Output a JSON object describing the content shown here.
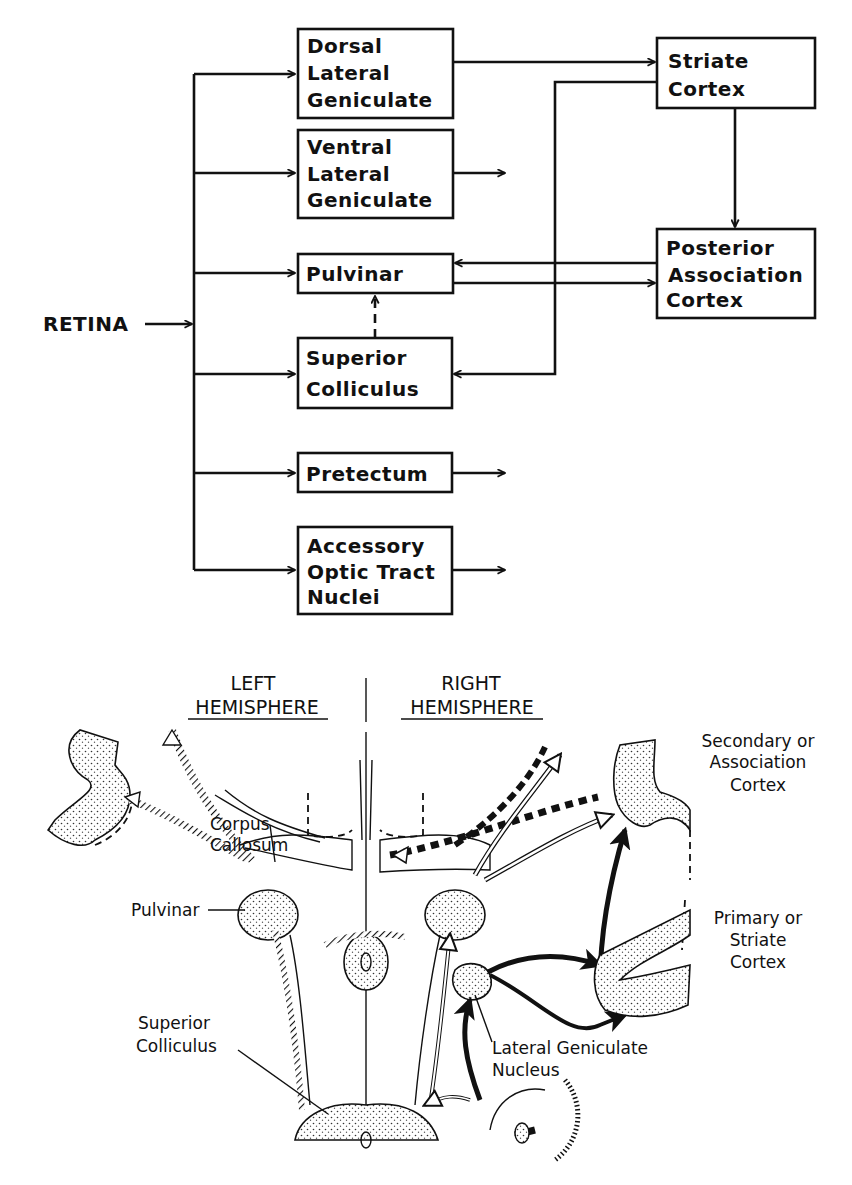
{
  "flowchart": {
    "source": "RETINA",
    "boxes": {
      "dorsal_lgn": [
        "Dorsal",
        "Lateral",
        "Geniculate"
      ],
      "ventral_lgn": [
        "Ventral",
        "Lateral",
        "Geniculate"
      ],
      "pulvinar": [
        "Pulvinar"
      ],
      "superior_colliculus": [
        "Superior",
        "Colliculus"
      ],
      "pretectum": [
        "Pretectum"
      ],
      "accessory_optic": [
        "Accessory",
        "Optic Tract",
        "Nuclei"
      ],
      "striate_cortex": [
        "Striate",
        "Cortex"
      ],
      "posterior_association": [
        "Posterior",
        "Association",
        "Cortex"
      ]
    },
    "connections": [
      {
        "from": "RETINA",
        "to": "dorsal_lgn"
      },
      {
        "from": "RETINA",
        "to": "ventral_lgn"
      },
      {
        "from": "RETINA",
        "to": "pulvinar"
      },
      {
        "from": "RETINA",
        "to": "superior_colliculus"
      },
      {
        "from": "RETINA",
        "to": "pretectum"
      },
      {
        "from": "RETINA",
        "to": "accessory_optic"
      },
      {
        "from": "dorsal_lgn",
        "to": "striate_cortex"
      },
      {
        "from": "striate_cortex",
        "to": "posterior_association"
      },
      {
        "from": "striate_cortex",
        "to": "superior_colliculus"
      },
      {
        "from": "posterior_association",
        "to": "pulvinar"
      },
      {
        "from": "pulvinar",
        "to": "posterior_association"
      },
      {
        "from": "superior_colliculus",
        "to": "pulvinar",
        "style": "dashed"
      },
      {
        "from": "ventral_lgn",
        "to": "(outflow)"
      },
      {
        "from": "pretectum",
        "to": "(outflow)"
      },
      {
        "from": "accessory_optic",
        "to": "(outflow)"
      }
    ]
  },
  "illustration": {
    "left_header": [
      "LEFT",
      "HEMISPHERE"
    ],
    "right_header": [
      "RIGHT",
      "HEMISPHERE"
    ],
    "labels": {
      "corpus_callosum": [
        "Corpus",
        "Callosum"
      ],
      "pulvinar": "Pulvinar",
      "superior_colliculus": [
        "Superior",
        "Colliculus"
      ],
      "lgn": [
        "Lateral Geniculate",
        "Nucleus"
      ],
      "secondary_cortex": [
        "Secondary or",
        "Association",
        "Cortex"
      ],
      "primary_cortex": [
        "Primary or",
        "Striate",
        "Cortex"
      ]
    }
  }
}
